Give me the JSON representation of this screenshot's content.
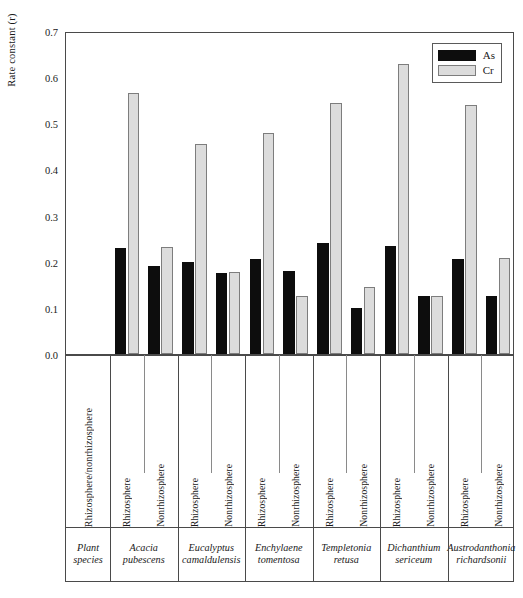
{
  "chart_data": {
    "type": "bar",
    "title": "",
    "xlabel": "",
    "ylabel": "Rate constant (r)",
    "ylim": [
      0.0,
      0.7
    ],
    "ytick_labels": [
      "0.7",
      "0.6",
      "0.5",
      "0.4",
      "0.3",
      "0.2",
      "0.1",
      "0.0"
    ],
    "ytick_values": [
      0.7,
      0.6,
      0.5,
      0.4,
      0.3,
      0.2,
      0.1,
      0.0
    ],
    "grid": false,
    "legend_position": "top-right",
    "series": [
      {
        "name": "As",
        "color": "#0d0d0d",
        "values": [
          0.23,
          0.19,
          0.2,
          0.175,
          0.205,
          0.18,
          0.24,
          0.1,
          0.235,
          0.125,
          0.205,
          0.125
        ]
      },
      {
        "name": "Cr",
        "color": "#dcdcdc",
        "values": [
          0.565,
          0.232,
          0.455,
          0.178,
          0.48,
          0.125,
          0.545,
          0.145,
          0.628,
          0.125,
          0.54,
          0.207
        ]
      }
    ],
    "categories": [
      "Acacia pubescens — Rhizosphere",
      "Acacia pubescens — Nonrhizosphere",
      "Eucalyptus camaldulensis — Rhizosphere",
      "Eucalyptus camaldulensis — Nonrhizosphere",
      "Enchylaena tomentosa — Rhizosphere",
      "Enchylaena tomentosa — Nonrhizosphere",
      "Templetonia retusa — Rhizosphere",
      "Templetonia retusa — Nonrhizosphere",
      "Dichanthium sericeum — Rhizosphere",
      "Dichanthium sericeum — Nonrhizosphere",
      "Austrodanthonia richardsonii — Rhizosphere",
      "Austrodanthonia richardsonii — Nonrhizosphere"
    ]
  },
  "legend": {
    "items": [
      {
        "label": "As",
        "swatch": "black"
      },
      {
        "label": "Cr",
        "swatch": "light-gray"
      }
    ]
  },
  "axis": {
    "y_title": "Rate constant (r)",
    "ticks": [
      "0.7",
      "0.6",
      "0.5",
      "0.4",
      "0.3",
      "0.2",
      "0.1",
      "0.0"
    ]
  },
  "table": {
    "row_header_label": "Rhizosphere/nonrhizosphere",
    "species_header_line1": "Plant",
    "species_header_line2": "species",
    "columns": [
      {
        "fraction": "Rhizosphere"
      },
      {
        "fraction": "Nonrhizosphere"
      },
      {
        "fraction": "Rhizosphere"
      },
      {
        "fraction": "Nonrhizosphere"
      },
      {
        "fraction": "Rhizosphere"
      },
      {
        "fraction": "Nonrhizosphere"
      },
      {
        "fraction": "Rhizosphere"
      },
      {
        "fraction": "Nonrhizosphere"
      },
      {
        "fraction": "Rhizosphere"
      },
      {
        "fraction": "Nonrhizosphere"
      },
      {
        "fraction": "Rhizosphere"
      },
      {
        "fraction": "Nonrhizosphere"
      }
    ],
    "species": [
      {
        "line1": "Acacia",
        "line2": "pubescens"
      },
      {
        "line1": "Eucalyptus",
        "line2": "camaldulensis"
      },
      {
        "line1": "Enchylaene",
        "line2": "tomentosa"
      },
      {
        "line1": "Templetonia",
        "line2": "retusa"
      },
      {
        "line1": "Dichanthium",
        "line2": "sericeum"
      },
      {
        "line1": "Austrodanthonia",
        "line2": "richardsonii"
      }
    ]
  },
  "colors": {
    "as": "#0d0d0d",
    "cr": "#dcdcdc",
    "cr_border": "#7d7d7d",
    "frame": "#4a4a4a"
  }
}
